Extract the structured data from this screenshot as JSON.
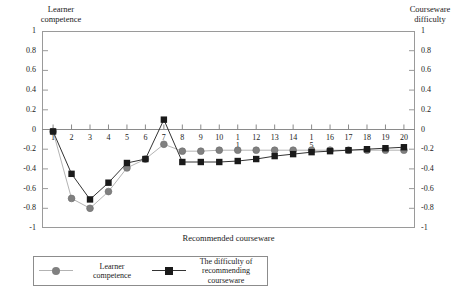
{
  "chart_data": {
    "type": "line",
    "title": "",
    "xlabel": "Recommended courseware",
    "ylabel_left": "Learner\ncompetence",
    "ylabel_right": "Courseware\ndifficulty",
    "x": [
      1,
      2,
      3,
      4,
      5,
      6,
      7,
      8,
      9,
      10,
      11,
      12,
      13,
      14,
      15,
      16,
      17,
      18,
      19,
      20
    ],
    "xticklabels": [
      "1",
      "2",
      "3",
      "4",
      "5",
      "6",
      "7",
      "8",
      "9",
      "10",
      "1\n1",
      "12",
      "13",
      "14",
      "1\n5",
      "16",
      "17",
      "18",
      "19",
      "20"
    ],
    "xlim": [
      0.4,
      20.6
    ],
    "ylim": [
      -1,
      1
    ],
    "yticks": [
      1,
      0.8,
      0.6,
      0.4,
      0.2,
      0,
      -0.2,
      -0.4,
      -0.6,
      -0.8,
      -1
    ],
    "yticklabels": [
      "1",
      "0.8",
      "0.6",
      "0.4",
      "0.2",
      "0",
      "-0.2",
      "-0.4",
      "-0.6",
      "-0.8",
      "-1"
    ],
    "grid": false,
    "legend_position": "below-left",
    "series": [
      {
        "name": "Learner\ncompetence",
        "marker": "circle",
        "color": "#808080",
        "line_color": "#b3b3b3",
        "values": [
          -0.02,
          -0.7,
          -0.8,
          -0.63,
          -0.39,
          -0.3,
          -0.15,
          -0.22,
          -0.22,
          -0.21,
          -0.21,
          -0.21,
          -0.21,
          -0.21,
          -0.21,
          -0.21,
          -0.21,
          -0.21,
          -0.21,
          -0.21
        ]
      },
      {
        "name": "The difficulty of\nrecommending courseware",
        "marker": "square",
        "color": "#1a1a1a",
        "line_color": "#333333",
        "values": [
          -0.02,
          -0.45,
          -0.71,
          -0.54,
          -0.34,
          -0.3,
          0.1,
          -0.33,
          -0.33,
          -0.33,
          -0.32,
          -0.3,
          -0.27,
          -0.25,
          -0.23,
          -0.22,
          -0.21,
          -0.2,
          -0.19,
          -0.18
        ]
      }
    ]
  },
  "legend": {
    "entries": [
      {
        "label": "Learner\ncompetence",
        "marker": "circle",
        "color": "#808080",
        "line_color": "#b3b3b3"
      },
      {
        "label": "The difficulty of\nrecommending courseware",
        "marker": "square",
        "color": "#1a1a1a",
        "line_color": "#333333"
      }
    ]
  }
}
